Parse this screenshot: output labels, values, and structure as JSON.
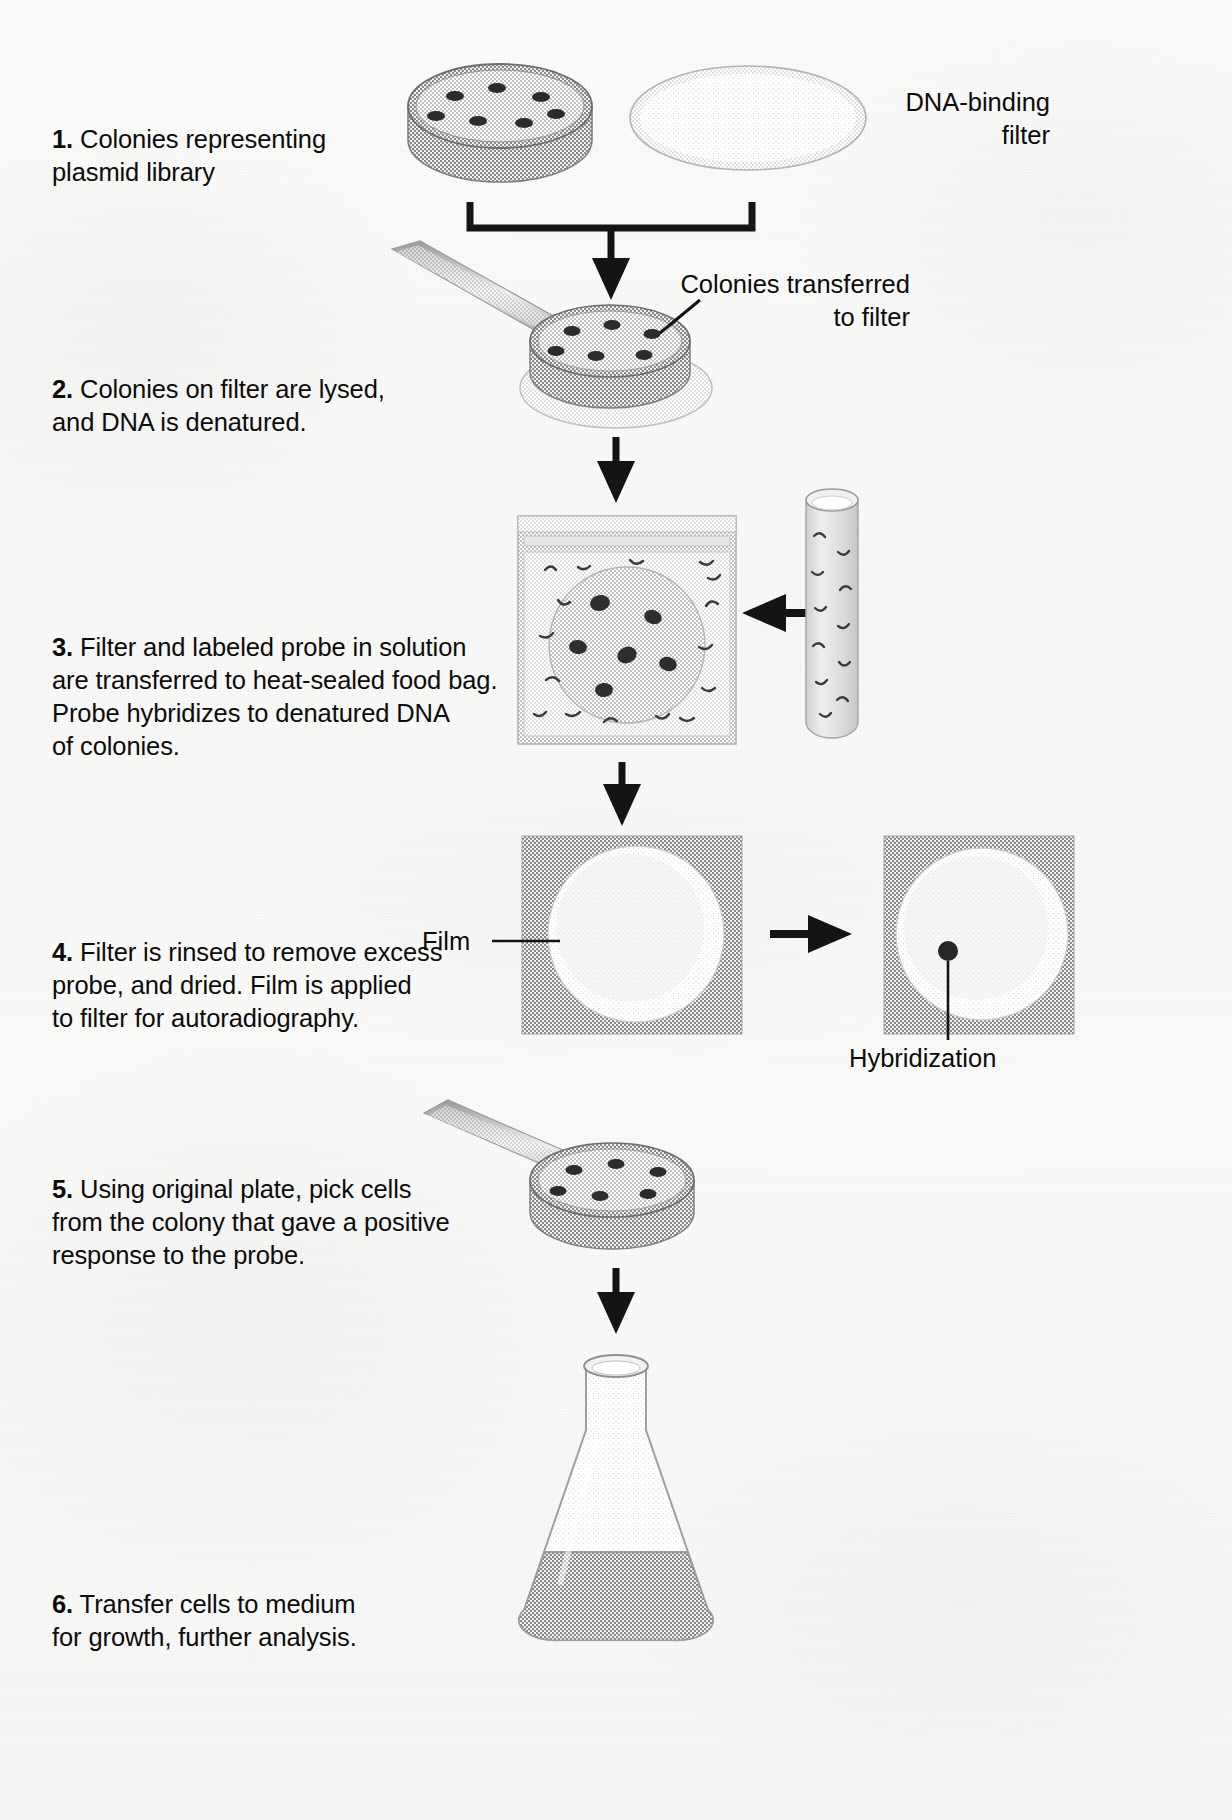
{
  "figure": {
    "type": "flow-diagram"
  },
  "steps": [
    {
      "number": "1.",
      "text": " Colonies representing\nplasmid library",
      "name": "step-1"
    },
    {
      "number": "2.",
      "text": " Colonies on filter are lysed,\nand DNA is denatured.",
      "name": "step-2"
    },
    {
      "number": "3.",
      "text": " Filter and labeled probe in solution\nare transferred to heat-sealed food bag.\nProbe hybridizes to denatured DNA\nof colonies.",
      "name": "step-3"
    },
    {
      "number": "4.",
      "text": " Filter is rinsed to remove excess\nprobe, and dried. Film is applied\nto filter for autoradiography.",
      "name": "step-4"
    },
    {
      "number": "5.",
      "text": " Using original plate, pick cells\nfrom the colony that gave a positive\nresponse to the probe.",
      "name": "step-5"
    },
    {
      "number": "6.",
      "text": " Transfer cells to medium\nfor growth, further analysis.",
      "name": "step-6"
    }
  ],
  "callouts": {
    "dna_binding_filter": "DNA-binding\nfilter",
    "colonies_transferred": "Colonies transferred\nto filter",
    "film": "Film",
    "hybridization": "Hybridization"
  },
  "colors": {
    "ink": "#0c0c0c",
    "arrow": "#1a1a1a",
    "plate_fill": "#b9b9b9",
    "plate_rim": "#8f8f8f",
    "colony": "#2f2f2f",
    "filter_fill": "#d8d8d8",
    "bag_fill": "#d2d2d2",
    "film_fill": "#c4c4c4",
    "film_disc": "#dcdcdc",
    "flask_medium": "#b0b0b0",
    "paper": "#f9f9f8"
  },
  "objects": {
    "plate_step1": {
      "colonies": 7,
      "label": "petri-dish-colonies"
    },
    "filter_disc": {
      "label": "dna-binding-filter-disc"
    },
    "plate_step2": {
      "colonies": 6,
      "label": "petri-dish-on-filter"
    },
    "bag": {
      "label": "heat-sealed-food-bag",
      "colonies": 6
    },
    "tube": {
      "label": "probe-solution-tube"
    },
    "film_left": {
      "label": "film-over-filter"
    },
    "film_right": {
      "label": "autoradiograph-with-spot",
      "spots": 1
    },
    "plate_step5": {
      "colonies": 6,
      "label": "original-plate-pick"
    },
    "flask": {
      "label": "erlenmeyer-flask-medium"
    },
    "pipette_step2": {
      "label": "pipette-tool"
    },
    "pipette_step5": {
      "label": "pipette-tool"
    }
  }
}
